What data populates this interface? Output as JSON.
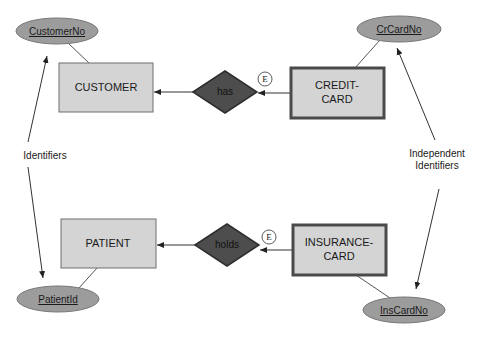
{
  "diagram": {
    "colors": {
      "entity_fill": "#d4d4d4",
      "entity_stroke": "#6e6e6e",
      "weak_entity_stroke": "#4a4a4a",
      "attribute_fill": "#9c9c9c",
      "relationship_fill": "#4d4d4d",
      "line": "#333333"
    },
    "entities": [
      {
        "id": "customer",
        "label_lines": [
          "CUSTOMER"
        ],
        "type": "strong"
      },
      {
        "id": "credit-card",
        "label_lines": [
          "CREDIT-",
          "CARD"
        ],
        "type": "existence-dependent"
      },
      {
        "id": "patient",
        "label_lines": [
          "PATIENT"
        ],
        "type": "strong"
      },
      {
        "id": "insurance-card",
        "label_lines": [
          "INSURANCE-",
          "CARD"
        ],
        "type": "existence-dependent"
      }
    ],
    "attributes": [
      {
        "id": "customerno",
        "label": "CustomerNo",
        "entity": "customer",
        "key": true
      },
      {
        "id": "crcardno",
        "label": "CrCardNo",
        "entity": "credit-card",
        "key": true
      },
      {
        "id": "patientid",
        "label": "PatientId",
        "entity": "patient",
        "key": true
      },
      {
        "id": "inscardno",
        "label": "InsCardNo",
        "entity": "insurance-card",
        "key": true
      }
    ],
    "relationships": [
      {
        "id": "has",
        "label": "has",
        "from": "credit-card",
        "to": "customer",
        "marker": "E"
      },
      {
        "id": "holds",
        "label": "holds",
        "from": "insurance-card",
        "to": "patient",
        "marker": "E"
      }
    ],
    "annotations": {
      "left": "Identifiers",
      "right_lines": [
        "Independent",
        "Identifiers"
      ]
    }
  }
}
